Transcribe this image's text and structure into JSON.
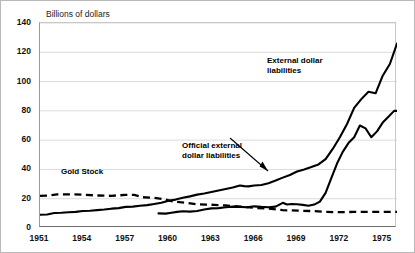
{
  "figure": {
    "axis_note": "Billions of dollars",
    "background_color": "#ffffff",
    "line_color": "#000000",
    "grid_color": "#d2d2d2"
  },
  "annotations": {
    "external": {
      "line1": "External dollar",
      "line2": "liabilities"
    },
    "official": {
      "line1": "Official external",
      "line2": "dollar liabilities"
    },
    "gold": {
      "line1": "Gold Stock"
    }
  },
  "chart_data": {
    "type": "line",
    "title": "",
    "subtitle": "",
    "xlabel": "",
    "ylabel": "Billions of dollars",
    "xlim": [
      1951,
      1976
    ],
    "ylim": [
      0,
      140
    ],
    "grid": true,
    "legend_position": "inline-annotations",
    "ytick_labels": [
      "0",
      "20",
      "40",
      "60",
      "80",
      "100",
      "120",
      "140"
    ],
    "yticks": [
      0,
      20,
      40,
      60,
      80,
      100,
      120,
      140
    ],
    "xtick_labels": [
      "1951",
      "1954",
      "1957",
      "1960",
      "1963",
      "1966",
      "1969",
      "1972",
      "1975"
    ],
    "xticks": [
      1951,
      1954,
      1957,
      1960,
      1963,
      1966,
      1969,
      1972,
      1975
    ],
    "series": [
      {
        "name": "External dollar liabilities",
        "style": "solid",
        "annotation": "External dollar liabilities",
        "x": [
          1951.0,
          1951.5,
          1952.0,
          1952.5,
          1953.0,
          1953.5,
          1954.0,
          1954.5,
          1955.0,
          1955.5,
          1956.0,
          1956.5,
          1957.0,
          1957.5,
          1958.0,
          1958.5,
          1959.0,
          1959.5,
          1960.0,
          1960.5,
          1961.0,
          1961.5,
          1962.0,
          1962.5,
          1963.0,
          1963.5,
          1964.0,
          1964.5,
          1965.0,
          1965.3,
          1965.6,
          1966.0,
          1966.5,
          1967.0,
          1967.5,
          1968.0,
          1968.5,
          1969.0,
          1969.5,
          1970.0,
          1970.5,
          1971.0,
          1971.5,
          1972.0,
          1972.5,
          1973.0,
          1973.5,
          1974.0,
          1974.5,
          1975.0,
          1975.5,
          1976.0
        ],
        "y": [
          9.0,
          9.2,
          10.2,
          10.4,
          10.8,
          11.0,
          11.6,
          11.8,
          12.2,
          12.6,
          13.2,
          13.6,
          14.4,
          14.6,
          15.2,
          15.6,
          16.4,
          17.2,
          18.6,
          19.4,
          20.6,
          21.6,
          22.8,
          23.6,
          24.6,
          25.6,
          26.6,
          27.6,
          29.0,
          28.6,
          28.4,
          29.0,
          29.4,
          30.6,
          32.4,
          34.4,
          36.2,
          38.6,
          40.0,
          41.6,
          43.4,
          47.0,
          54.0,
          62.0,
          71.0,
          82.0,
          88.0,
          93.0,
          92.0,
          104.0,
          112.0,
          126.0
        ]
      },
      {
        "name": "Official external dollar liabilities",
        "style": "solid",
        "annotation": "Official external dollar liabilities",
        "x": [
          1959.3,
          1959.8,
          1960.2,
          1960.6,
          1961.0,
          1961.5,
          1962.0,
          1962.5,
          1963.0,
          1963.5,
          1964.0,
          1964.5,
          1965.0,
          1965.5,
          1966.0,
          1966.5,
          1967.0,
          1967.5,
          1968.0,
          1968.3,
          1968.6,
          1969.0,
          1969.4,
          1969.8,
          1970.2,
          1970.6,
          1971.0,
          1971.4,
          1971.8,
          1972.2,
          1972.6,
          1973.0,
          1973.4,
          1973.8,
          1974.2,
          1974.6,
          1975.0,
          1975.4,
          1975.8,
          1976.0
        ],
        "y": [
          10.0,
          9.8,
          10.4,
          11.0,
          11.4,
          11.2,
          11.6,
          12.6,
          13.4,
          13.6,
          14.2,
          14.6,
          14.4,
          14.2,
          14.8,
          14.4,
          14.2,
          14.6,
          17.2,
          16.0,
          16.4,
          16.2,
          15.8,
          15.2,
          16.0,
          18.0,
          24.0,
          34.0,
          44.0,
          52.0,
          58.0,
          62.0,
          70.0,
          68.0,
          62.0,
          66.0,
          72.0,
          76.0,
          80.0,
          80.0
        ]
      },
      {
        "name": "Gold Stock",
        "style": "dashed",
        "annotation": "Gold Stock",
        "x": [
          1951.0,
          1951.6,
          1952.2,
          1953.0,
          1954.0,
          1955.0,
          1956.0,
          1957.0,
          1957.6,
          1958.2,
          1959.0,
          1959.6,
          1960.2,
          1960.8,
          1961.4,
          1962.0,
          1962.6,
          1963.2,
          1964.0,
          1965.0,
          1966.0,
          1967.0,
          1968.0,
          1968.6,
          1969.2,
          1970.0,
          1971.0,
          1972.0,
          1973.0,
          1974.0,
          1975.0,
          1976.0
        ],
        "y": [
          22.0,
          22.2,
          23.0,
          23.0,
          22.8,
          22.2,
          22.0,
          22.6,
          22.6,
          21.0,
          20.6,
          19.8,
          18.4,
          17.6,
          17.0,
          16.2,
          16.0,
          15.8,
          15.4,
          14.6,
          13.8,
          13.2,
          12.2,
          12.0,
          11.8,
          11.6,
          11.0,
          10.8,
          11.0,
          11.0,
          11.0,
          11.0
        ]
      }
    ]
  }
}
